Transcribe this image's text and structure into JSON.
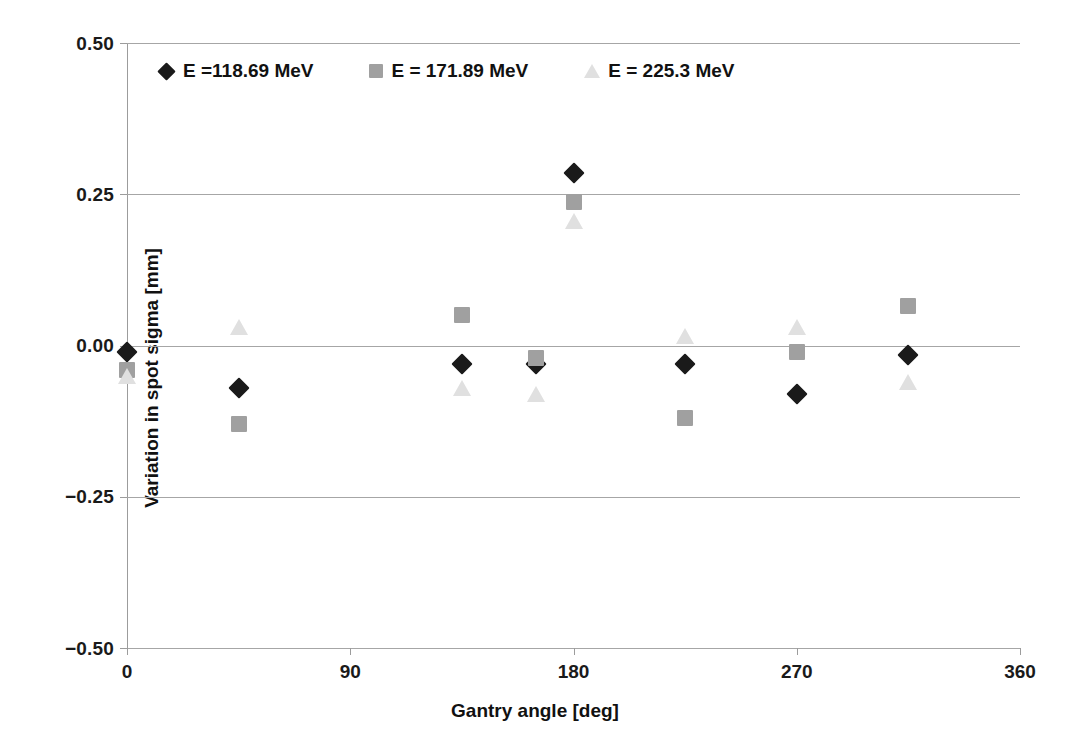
{
  "chart_data": {
    "type": "scatter",
    "title": "",
    "xlabel": "Gantry angle [deg]",
    "ylabel": "Variation in spot sigma [mm]",
    "xlim": [
      0,
      360
    ],
    "ylim": [
      -0.5,
      0.5
    ],
    "xticks": [
      "0",
      "90",
      "180",
      "270",
      "360"
    ],
    "xtick_values": [
      0,
      90,
      180,
      270,
      360
    ],
    "yticks": [
      "0.50",
      "0.25",
      "0.00",
      "−0.25",
      "−0.50"
    ],
    "ytick_values": [
      0.5,
      0.25,
      0.0,
      -0.25,
      -0.5
    ],
    "grid": "horizontal",
    "legend_position": "top-left-inside",
    "series": [
      {
        "name": "E =118.69 MeV",
        "marker": "diamond",
        "color": "#1a1a1a",
        "x": [
          0,
          45,
          135,
          165,
          180,
          225,
          270,
          315
        ],
        "y": [
          -0.01,
          -0.07,
          -0.03,
          -0.03,
          0.285,
          -0.03,
          -0.08,
          -0.015
        ]
      },
      {
        "name": "E = 171.89 MeV",
        "marker": "square",
        "color": "#a0a0a0",
        "x": [
          0,
          45,
          135,
          165,
          180,
          225,
          270,
          315
        ],
        "y": [
          -0.04,
          -0.13,
          0.05,
          -0.02,
          0.237,
          -0.12,
          -0.01,
          0.065
        ]
      },
      {
        "name": "E = 225.3 MeV",
        "marker": "triangle",
        "color": "#e0e0e0",
        "x": [
          0,
          45,
          135,
          165,
          180,
          225,
          270,
          315
        ],
        "y": [
          -0.05,
          0.03,
          -0.07,
          -0.08,
          0.205,
          0.015,
          0.03,
          -0.06
        ]
      }
    ]
  },
  "legend": {
    "entries": [
      {
        "label": "E =118.69 MeV",
        "marker": "diamond"
      },
      {
        "label": "E = 171.89 MeV",
        "marker": "square"
      },
      {
        "label": "E = 225.3 MeV",
        "marker": "triangle"
      }
    ]
  }
}
